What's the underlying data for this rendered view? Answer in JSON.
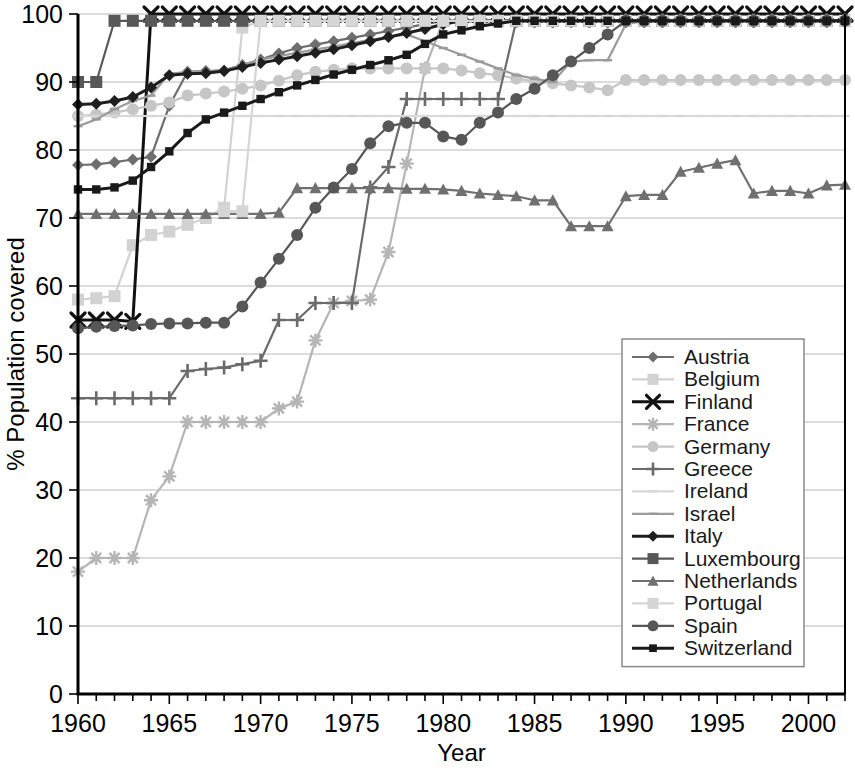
{
  "chart_data": {
    "type": "line",
    "title": "",
    "xlabel": "Year",
    "ylabel": "% Population covered",
    "xlim": [
      1960,
      2002
    ],
    "ylim": [
      0,
      100
    ],
    "grid": true,
    "legend_position": "inside-right-lower",
    "x_ticks": [
      1960,
      1965,
      1970,
      1975,
      1980,
      1985,
      1990,
      1995,
      2000
    ],
    "x_tick_labels": [
      "1960",
      "1965",
      "1970",
      "1975",
      "1980",
      "1985",
      "1990",
      "1995",
      "2000"
    ],
    "x_minor_tick_step": 1,
    "y_ticks": [
      0,
      10,
      20,
      30,
      40,
      50,
      60,
      70,
      80,
      90,
      100
    ],
    "y_tick_labels": [
      "0",
      "10",
      "20",
      "30",
      "40",
      "50",
      "60",
      "70",
      "80",
      "90",
      "100"
    ],
    "x": [
      1960,
      1961,
      1962,
      1963,
      1964,
      1965,
      1966,
      1967,
      1968,
      1969,
      1970,
      1971,
      1972,
      1973,
      1974,
      1975,
      1976,
      1977,
      1978,
      1979,
      1980,
      1981,
      1982,
      1983,
      1984,
      1985,
      1986,
      1987,
      1988,
      1989,
      1990,
      1991,
      1992,
      1993,
      1994,
      1995,
      1996,
      1997,
      1998,
      1999,
      2000,
      2001,
      2002
    ],
    "series": [
      {
        "name": "Austria",
        "marker": "diamond",
        "color": "#6e6e6e",
        "values": [
          77.8,
          77.9,
          78.2,
          78.6,
          79.0,
          86.5,
          91.5,
          91.6,
          91.7,
          92.5,
          93.3,
          94.2,
          95.0,
          95.5,
          96.0,
          96.5,
          97.0,
          97.5,
          98.0,
          98.5,
          99.0,
          99.0,
          99.0,
          99.0,
          99.0,
          99.0,
          99.0,
          99.0,
          99.0,
          99.0,
          99.0,
          99.0,
          99.0,
          99.0,
          99.0,
          99.0,
          99.0,
          99.0,
          99.0,
          99.0,
          99.0,
          99.0,
          99.0
        ]
      },
      {
        "name": "Belgium",
        "marker": "square",
        "color": "#d2d2d2",
        "values": [
          58.0,
          58.2,
          58.5,
          66.0,
          67.5,
          68.0,
          69.0,
          70.0,
          71.5,
          98.0,
          99.0,
          99.0,
          99.0,
          99.0,
          99.0,
          99.0,
          99.0,
          99.0,
          99.0,
          99.0,
          99.0,
          99.0,
          99.0,
          99.0,
          99.0,
          99.0,
          99.0,
          99.0,
          99.0,
          99.0,
          99.0,
          99.0,
          99.0,
          99.0,
          99.0,
          99.0,
          99.0,
          99.0,
          99.0,
          99.0,
          99.0,
          99.0,
          99.0
        ]
      },
      {
        "name": "Finland",
        "marker": "x",
        "color": "#111111",
        "values": [
          55.0,
          55.0,
          55.0,
          54.8,
          100.0,
          100.0,
          100.0,
          100.0,
          100.0,
          100.0,
          100.0,
          100.0,
          100.0,
          100.0,
          100.0,
          100.0,
          100.0,
          100.0,
          100.0,
          100.0,
          100.0,
          100.0,
          100.0,
          100.0,
          100.0,
          100.0,
          100.0,
          100.0,
          100.0,
          100.0,
          100.0,
          100.0,
          100.0,
          100.0,
          100.0,
          100.0,
          100.0,
          100.0,
          100.0,
          100.0,
          100.0,
          100.0,
          100.0
        ]
      },
      {
        "name": "France",
        "marker": "star",
        "color": "#b5b5b5",
        "values": [
          18.0,
          20.0,
          20.0,
          20.0,
          28.5,
          32.0,
          40.0,
          40.0,
          40.0,
          40.0,
          40.0,
          42.0,
          43.0,
          52.0,
          57.5,
          57.8,
          58.0,
          65.0,
          78.0,
          92.0,
          99.0,
          99.0,
          99.0,
          99.0,
          99.0,
          99.0,
          99.0,
          99.0,
          99.0,
          99.0,
          99.0,
          99.0,
          99.0,
          99.0,
          99.0,
          99.0,
          99.0,
          99.0,
          99.0,
          99.0,
          99.0,
          99.0,
          99.0
        ]
      },
      {
        "name": "Germany",
        "marker": "circle",
        "color": "#c6c6c6",
        "values": [
          85.0,
          85.2,
          85.5,
          86.0,
          86.5,
          87.0,
          88.0,
          88.3,
          88.6,
          89.0,
          89.5,
          90.2,
          91.0,
          91.5,
          91.8,
          92.0,
          92.0,
          92.0,
          92.0,
          92.0,
          92.0,
          91.7,
          91.3,
          91.0,
          90.5,
          90.1,
          89.8,
          89.5,
          89.2,
          88.8,
          90.3,
          90.3,
          90.3,
          90.3,
          90.3,
          90.3,
          90.3,
          90.3,
          90.3,
          90.3,
          90.3,
          90.3,
          90.3
        ]
      },
      {
        "name": "Greece",
        "marker": "plus",
        "color": "#6b6b6b",
        "values": [
          43.5,
          43.5,
          43.5,
          43.5,
          43.5,
          43.5,
          47.5,
          47.8,
          48.0,
          48.5,
          49.0,
          55.0,
          55.0,
          57.5,
          57.5,
          57.5,
          74.5,
          77.5,
          87.5,
          87.5,
          87.5,
          87.5,
          87.5,
          87.5,
          99.0,
          99.0,
          99.0,
          99.0,
          99.0,
          99.0,
          99.0,
          99.0,
          99.0,
          99.0,
          99.0,
          99.0,
          99.0,
          99.0,
          99.0,
          99.0,
          99.0,
          99.0,
          99.0
        ]
      },
      {
        "name": "Ireland",
        "marker": "dash",
        "color": "#d8d8d8",
        "values": [
          85.0,
          85.0,
          85.0,
          85.0,
          85.0,
          85.0,
          85.0,
          85.0,
          85.0,
          85.0,
          85.0,
          85.0,
          85.0,
          85.0,
          85.0,
          85.0,
          85.0,
          85.0,
          85.0,
          85.0,
          85.0,
          85.0,
          85.0,
          85.0,
          85.0,
          85.0,
          85.0,
          85.0,
          85.0,
          85.0,
          85.0,
          85.0,
          85.0,
          85.0,
          85.0,
          85.0,
          85.0,
          85.0,
          85.0,
          85.0,
          85.0,
          85.0,
          85.0
        ]
      },
      {
        "name": "Israel",
        "marker": "dash",
        "color": "#9b9b9b",
        "values": [
          83.5,
          84.5,
          86.0,
          87.2,
          88.0,
          91.2,
          91.5,
          91.5,
          91.8,
          92.5,
          93.3,
          93.8,
          94.3,
          94.8,
          95.2,
          95.7,
          96.2,
          96.6,
          97.0,
          96.0,
          95.0,
          94.0,
          93.0,
          92.0,
          91.0,
          90.5,
          90.0,
          93.0,
          93.2,
          93.2,
          98.5,
          99.0,
          99.0,
          99.0,
          99.0,
          99.0,
          99.0,
          99.0,
          99.0,
          99.0,
          99.0,
          99.0,
          99.0
        ]
      },
      {
        "name": "Italy",
        "marker": "diamond",
        "color": "#1f1f1f",
        "values": [
          86.7,
          86.8,
          87.2,
          87.8,
          89.2,
          91.0,
          91.2,
          91.3,
          91.6,
          92.2,
          92.8,
          93.3,
          93.8,
          94.3,
          94.8,
          95.4,
          96.0,
          96.6,
          97.2,
          97.8,
          98.5,
          99.0,
          99.0,
          99.0,
          99.0,
          99.0,
          99.0,
          99.0,
          99.0,
          99.0,
          99.0,
          99.0,
          99.0,
          99.0,
          99.0,
          99.0,
          99.0,
          99.0,
          99.0,
          99.0,
          99.0,
          99.0,
          99.0
        ]
      },
      {
        "name": "Luxembourg",
        "marker": "square",
        "color": "#585858",
        "values": [
          90.0,
          90.0,
          99.0,
          99.0,
          99.0,
          99.0,
          99.0,
          99.0,
          99.0,
          99.0,
          99.0,
          99.0,
          99.0,
          99.0,
          99.0,
          99.0,
          99.0,
          99.0,
          99.0,
          99.0,
          99.0,
          99.0,
          99.0,
          99.0,
          99.0,
          99.0,
          99.0,
          99.0,
          99.0,
          99.0,
          99.0,
          99.0,
          99.0,
          99.0,
          99.0,
          99.0,
          99.0,
          99.0,
          99.0,
          99.0,
          99.0,
          99.0,
          99.0
        ]
      },
      {
        "name": "Netherlands",
        "marker": "triangle",
        "color": "#707070",
        "values": [
          70.6,
          70.6,
          70.6,
          70.6,
          70.6,
          70.6,
          70.6,
          70.6,
          70.6,
          70.6,
          70.6,
          70.8,
          74.4,
          74.4,
          74.4,
          74.4,
          74.4,
          74.4,
          74.3,
          74.3,
          74.2,
          74.0,
          73.6,
          73.4,
          73.2,
          72.6,
          72.6,
          68.8,
          68.8,
          68.8,
          73.2,
          73.4,
          73.4,
          76.8,
          77.4,
          78.0,
          78.5,
          73.6,
          74.0,
          74.0,
          73.6,
          74.8,
          74.9
        ]
      },
      {
        "name": "Portugal",
        "marker": "square",
        "color": "#d6d6d6",
        "values": [
          0.0,
          0.0,
          0.0,
          0.0,
          0.0,
          0.0,
          0.0,
          0.0,
          71.0,
          71.0,
          99.0,
          99.0,
          99.0,
          99.0,
          99.0,
          99.0,
          99.0,
          99.0,
          99.0,
          99.0,
          99.0,
          99.0,
          99.0,
          99.0,
          99.0,
          99.0,
          99.0,
          99.0,
          99.0,
          99.0,
          99.0,
          99.0,
          99.0,
          99.0,
          99.0,
          99.0,
          99.0,
          99.0,
          99.0,
          99.0,
          99.0,
          99.0,
          99.0
        ]
      },
      {
        "name": "Spain",
        "marker": "circle",
        "color": "#575757",
        "values": [
          53.8,
          54.0,
          54.1,
          54.2,
          54.4,
          54.5,
          54.5,
          54.6,
          54.6,
          57.0,
          60.5,
          64.0,
          67.5,
          71.5,
          74.5,
          77.2,
          81.0,
          83.5,
          84.0,
          84.0,
          82.0,
          81.5,
          84.0,
          85.5,
          87.5,
          89.0,
          91.0,
          93.0,
          95.0,
          97.0,
          99.0,
          99.0,
          99.0,
          99.0,
          99.0,
          99.0,
          99.0,
          99.0,
          99.0,
          99.0,
          99.0,
          99.0,
          99.0
        ]
      },
      {
        "name": "Switzerland",
        "marker": "smallsquare",
        "color": "#1a1a1a",
        "values": [
          74.2,
          74.2,
          74.5,
          75.5,
          77.5,
          79.8,
          82.5,
          84.5,
          85.5,
          86.5,
          87.5,
          88.5,
          89.5,
          90.3,
          91.1,
          91.8,
          92.5,
          93.2,
          94.0,
          95.6,
          97.0,
          97.6,
          98.2,
          98.6,
          99.0,
          99.0,
          99.0,
          99.0,
          99.0,
          99.0,
          99.0,
          99.0,
          99.0,
          99.0,
          99.0,
          99.0,
          99.0,
          99.0,
          99.0,
          99.0,
          99.0,
          99.0,
          99.0
        ]
      }
    ]
  },
  "legend": {
    "entries": [
      {
        "label": "Austria"
      },
      {
        "label": "Belgium"
      },
      {
        "label": "Finland"
      },
      {
        "label": "France"
      },
      {
        "label": "Germany"
      },
      {
        "label": "Greece"
      },
      {
        "label": "Ireland"
      },
      {
        "label": "Israel"
      },
      {
        "label": "Italy"
      },
      {
        "label": "Luxembourg"
      },
      {
        "label": "Netherlands"
      },
      {
        "label": "Portugal"
      },
      {
        "label": "Spain"
      },
      {
        "label": "Switzerland"
      }
    ]
  }
}
